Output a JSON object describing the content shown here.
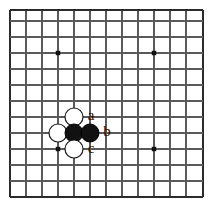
{
  "figure": {
    "kind": "go-board-diagram",
    "title": "",
    "background_color": "#ffffff"
  },
  "board": {
    "line_color": "#5a5a5a",
    "border_color": "#2b2b2b",
    "star_point_color": "#111111",
    "cell_size": 16,
    "origin_x": 10,
    "origin_y": 10,
    "cols": 13,
    "rows": 12,
    "star_points": [
      {
        "name": "star-point-top-left",
        "x": 58,
        "y": 53
      },
      {
        "name": "star-point-top-right",
        "x": 154,
        "y": 53
      },
      {
        "name": "star-point-bottom-left",
        "x": 58,
        "y": 149
      },
      {
        "name": "star-point-bottom-right",
        "x": 154,
        "y": 149
      }
    ],
    "vertical_lines_x": [
      10,
      26,
      42,
      58,
      74,
      90,
      106,
      122,
      138,
      154,
      170,
      186,
      203
    ],
    "horizontal_lines_y": [
      10,
      21,
      37,
      53,
      69,
      85,
      101,
      117,
      133,
      149,
      165,
      181,
      197
    ]
  },
  "stones": [
    {
      "id": "white-stone-top",
      "color": "white",
      "x": 74,
      "y": 117,
      "radius": 9
    },
    {
      "id": "white-stone-left",
      "color": "white",
      "x": 58,
      "y": 133,
      "radius": 9
    },
    {
      "id": "black-stone-left",
      "color": "black",
      "x": 74,
      "y": 133,
      "radius": 9
    },
    {
      "id": "black-stone-right",
      "color": "black",
      "x": 90,
      "y": 133,
      "radius": 9
    },
    {
      "id": "white-stone-bottom",
      "color": "white",
      "x": 74,
      "y": 149,
      "radius": 9
    }
  ],
  "stone_colors": {
    "white_fill": "#ffffff",
    "white_stroke": "#1a1a1a",
    "black_fill": "#111111",
    "black_stroke": "#000000"
  },
  "labels": [
    {
      "id": "label-a",
      "text": "a",
      "x": 91,
      "y": 117
    },
    {
      "id": "label-b",
      "text": "b",
      "x": 107,
      "y": 133
    },
    {
      "id": "label-c",
      "text": "c",
      "x": 91,
      "y": 150
    }
  ]
}
